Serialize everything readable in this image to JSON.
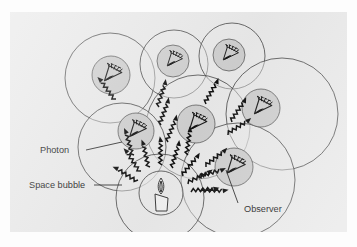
{
  "figure": {
    "panel": {
      "background_color": "#e9e9e9",
      "outer_background_color": "#fdfdfd",
      "x": 10,
      "y": 12,
      "width": 337,
      "height": 220
    },
    "ink_color": "#1a1a1a",
    "core_fill_color": "#cfcfcf"
  },
  "labels": [
    {
      "id": "photon",
      "text": "Photon",
      "x": 40,
      "y": 151
    },
    {
      "id": "space-bubble",
      "text": "Space bubble",
      "x": 29,
      "y": 185
    },
    {
      "id": "observer",
      "text": "Observer",
      "x": 244,
      "y": 209
    }
  ],
  "space_bubbles": [
    {
      "id": "bubble-1",
      "cx": 100,
      "cy": 66,
      "r": 45
    },
    {
      "id": "bubble-2",
      "cx": 164,
      "cy": 52,
      "r": 34
    },
    {
      "id": "bubble-3",
      "cx": 222,
      "cy": 48,
      "r": 33
    },
    {
      "id": "bubble-4",
      "cx": 188,
      "cy": 115,
      "r": 52
    },
    {
      "id": "bubble-5",
      "cx": 268,
      "cy": 105,
      "r": 56
    },
    {
      "id": "bubble-6",
      "cx": 112,
      "cy": 135,
      "r": 44
    },
    {
      "id": "bubble-7",
      "cx": 226,
      "cy": 166,
      "r": 57
    },
    {
      "id": "bubble-8",
      "cx": 153,
      "cy": 183,
      "r": 44
    }
  ],
  "observers": [
    {
      "id": "observer-1",
      "cx": 101,
      "cy": 63,
      "r": 19,
      "facing": "right"
    },
    {
      "id": "observer-2",
      "cx": 163,
      "cy": 49,
      "r": 16,
      "facing": "right"
    },
    {
      "id": "observer-3",
      "cx": 219,
      "cy": 45,
      "r": 16,
      "facing": "right"
    },
    {
      "id": "observer-4",
      "cx": 184,
      "cy": 110,
      "r": 19,
      "facing": "right"
    },
    {
      "id": "observer-5",
      "cx": 249,
      "cy": 97,
      "r": 19,
      "facing": "right"
    },
    {
      "id": "observer-6",
      "cx": 126,
      "cy": 119,
      "r": 18,
      "facing": "right"
    },
    {
      "id": "observer-7",
      "cx": 222,
      "cy": 156,
      "r": 19,
      "facing": "right"
    }
  ],
  "light_source": {
    "id": "candle",
    "cx": 150,
    "cy": 180,
    "r": 22,
    "description": "candle with flame at centre of diagram"
  },
  "photons": [
    {
      "id": "photon-ray-1",
      "from": "candle",
      "to": "observer-1",
      "angle": -118
    },
    {
      "id": "photon-ray-2",
      "from": "candle",
      "to": "observer-6",
      "angle": -100
    },
    {
      "id": "photon-ray-3",
      "from": "candle",
      "to": "observer-4",
      "angle": -72
    },
    {
      "id": "photon-ray-4",
      "from": "candle",
      "to": "observer-4b",
      "angle": -58
    },
    {
      "id": "photon-ray-5",
      "from": "candle",
      "to": "observer-7",
      "angle": -20
    },
    {
      "id": "photon-ray-6",
      "from": "candle",
      "to": "observer-7b",
      "angle": -8
    },
    {
      "id": "photon-ray-7",
      "from": "candle",
      "to": "observer-2",
      "angle": -85
    },
    {
      "id": "photon-ray-8",
      "from": "candle",
      "to": "observer-5",
      "angle": -38
    },
    {
      "id": "photon-ray-9",
      "from": "candle",
      "to": "observer-3",
      "angle": -62
    },
    {
      "id": "photon-ray-10",
      "from": "candle",
      "to": "observer-1b",
      "angle": -135
    }
  ]
}
